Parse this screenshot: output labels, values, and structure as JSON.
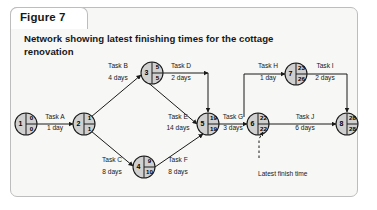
{
  "figure": {
    "tab_label": "Figure 7",
    "title": "Network showing latest finishing times for the cottage renovation"
  },
  "annotation": {
    "latest_finish_label": "Latest finish time"
  },
  "colors": {
    "card_background": "#f7f7f5",
    "card_border": "#bdbdbd",
    "node_fill": "#d0d0d0",
    "node_stroke": "#1a1a1a",
    "line": "#1a1a1a",
    "text": "#16181a"
  },
  "nodes": [
    {
      "id": "n1",
      "event": "1",
      "earliest": "0",
      "latest": "0",
      "cx": 26,
      "cy": 124
    },
    {
      "id": "n2",
      "event": "2",
      "earliest": "1",
      "latest": "1",
      "cx": 84,
      "cy": 124
    },
    {
      "id": "n3",
      "event": "3",
      "earliest": "5",
      "latest": "5",
      "cx": 152,
      "cy": 73
    },
    {
      "id": "n4",
      "event": "4",
      "earliest": "9",
      "latest": "10",
      "cx": 144,
      "cy": 167
    },
    {
      "id": "n5",
      "event": "5",
      "earliest": "19",
      "latest": "19",
      "cx": 208,
      "cy": 124
    },
    {
      "id": "n6",
      "event": "6",
      "earliest": "22",
      "latest": "22",
      "cx": 258,
      "cy": 124
    },
    {
      "id": "n7",
      "event": "7",
      "earliest": "23",
      "latest": "26",
      "cx": 296,
      "cy": 74
    },
    {
      "id": "n8",
      "event": "8",
      "earliest": "28",
      "latest": "28",
      "cx": 347,
      "cy": 124
    }
  ],
  "activities": [
    {
      "id": "taskA",
      "name": "Task A",
      "duration": "1 day",
      "from": "n1",
      "to": "n2",
      "label_x": 55,
      "name_y": 119,
      "dur_y": 130
    },
    {
      "id": "taskB",
      "name": "Task B",
      "duration": "4 days",
      "from": "n2",
      "to": "n3",
      "label_x": 118,
      "name_y": 68,
      "dur_y": 80
    },
    {
      "id": "taskC",
      "name": "Task C",
      "duration": "8 days",
      "from": "n2",
      "to": "n4",
      "label_x": 112,
      "name_y": 162,
      "dur_y": 174
    },
    {
      "id": "taskD",
      "name": "Task D",
      "duration": "2 days",
      "from": "n3",
      "to": "n5",
      "label_x": 181,
      "name_y": 68,
      "dur_y": 80
    },
    {
      "id": "taskE",
      "name": "Task E",
      "duration": "14 days",
      "from": "n3",
      "to": "n5",
      "label_x": 178,
      "name_y": 119,
      "dur_y": 130
    },
    {
      "id": "taskF",
      "name": "Task F",
      "duration": "8 days",
      "from": "n4",
      "to": "n5",
      "label_x": 178,
      "name_y": 162,
      "dur_y": 174
    },
    {
      "id": "taskG",
      "name": "Task G",
      "duration": "3 days",
      "from": "n5",
      "to": "n6",
      "label_x": 233,
      "name_y": 119,
      "dur_y": 130
    },
    {
      "id": "taskH",
      "name": "Task H",
      "duration": "1 day",
      "from": "n6",
      "to": "n7",
      "label_x": 268,
      "name_y": 68,
      "dur_y": 80
    },
    {
      "id": "taskI",
      "name": "Task I",
      "duration": "2 days",
      "from": "n7",
      "to": "n8",
      "label_x": 325,
      "name_y": 68,
      "dur_y": 80
    },
    {
      "id": "taskJ",
      "name": "Task J",
      "duration": "6 days",
      "from": "n6",
      "to": "n8",
      "label_x": 305,
      "name_y": 119,
      "dur_y": 130
    }
  ]
}
